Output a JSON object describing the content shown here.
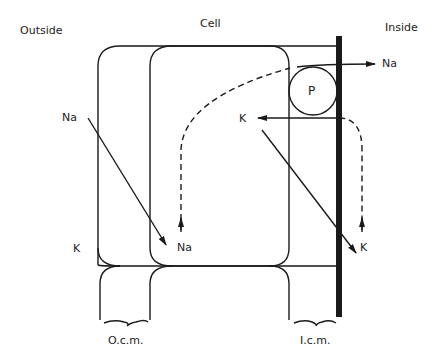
{
  "labels": {
    "outside": "Outside",
    "cell": "Cell",
    "inside": "Inside",
    "na_outside": "Na",
    "na_cell": "Na",
    "na_inside": "Na",
    "k_outside": "K",
    "k_cell": "K",
    "k_inside": "K",
    "pump": "P",
    "ocm": "O.c.m.",
    "icm": "I.c.m."
  },
  "colors": {
    "line": "#1a1a1a",
    "background": "#ffffff"
  }
}
